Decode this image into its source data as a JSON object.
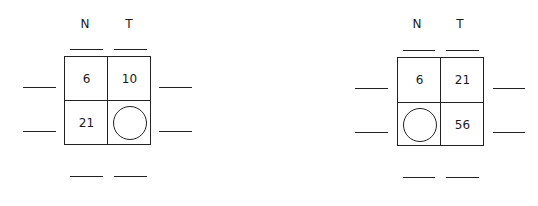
{
  "puzzles": [
    {
      "headers": [
        "N",
        "T"
      ],
      "cells": [
        [
          "6",
          "10"
        ],
        [
          "21",
          ""
        ]
      ],
      "unknown_cell": "row2-col2"
    },
    {
      "headers": [
        "N",
        "T"
      ],
      "cells": [
        [
          "6",
          "21"
        ],
        [
          "",
          "56"
        ]
      ],
      "unknown_cell": "row2-col1"
    }
  ]
}
